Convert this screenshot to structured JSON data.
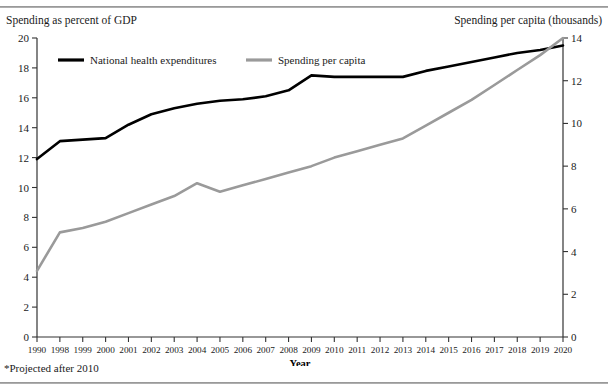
{
  "header": {
    "left_axis_title": "Spending as percent of GDP",
    "right_axis_title": "Spending per capita (thousands)"
  },
  "footnote": "*Projected after 2010",
  "legend": [
    {
      "label": "National health expenditures",
      "color": "#000000",
      "key": "nhe-legend-swatch"
    },
    {
      "label": "Spending per capita",
      "color": "#9a9a9a",
      "key": "spc-legend-swatch"
    }
  ],
  "chart_data": {
    "type": "line",
    "title": "",
    "xlabel": "Year",
    "categories": [
      "1990",
      "1998",
      "1999",
      "2000",
      "2001",
      "2002",
      "2003",
      "2004",
      "2005",
      "2006",
      "2007",
      "2008",
      "2009",
      "2010",
      "2011",
      "2012",
      "2013",
      "2014",
      "2015",
      "2016",
      "2017",
      "2018",
      "2019",
      "2020"
    ],
    "grid": false,
    "legend_position": "top-inside",
    "axes": {
      "left": {
        "label": "Spending as percent of GDP",
        "ticks": [
          0,
          2,
          4,
          6,
          8,
          10,
          12,
          14,
          16,
          18,
          20
        ],
        "ylim": [
          0,
          20
        ]
      },
      "right": {
        "label": "Spending per capita (thousands)",
        "ticks": [
          0,
          2,
          4,
          6,
          8,
          10,
          12,
          14
        ],
        "ylim": [
          0,
          14
        ]
      }
    },
    "series": [
      {
        "name": "National health expenditures",
        "axis": "left",
        "color": "#000000",
        "width": 2.6,
        "values": [
          11.9,
          13.1,
          13.2,
          13.3,
          14.2,
          14.9,
          15.3,
          15.6,
          15.8,
          15.9,
          16.1,
          16.5,
          17.5,
          17.4,
          17.4,
          17.4,
          17.4,
          17.8,
          18.1,
          18.4,
          18.7,
          19.0,
          19.2,
          19.5
        ]
      },
      {
        "name": "Spending per capita",
        "axis": "right",
        "color": "#9a9a9a",
        "width": 2.6,
        "values": [
          3.1,
          4.9,
          5.1,
          5.4,
          5.8,
          6.2,
          6.6,
          7.2,
          6.8,
          7.1,
          7.4,
          7.7,
          8.0,
          8.4,
          8.7,
          9.0,
          9.3,
          9.9,
          10.5,
          11.1,
          11.8,
          12.5,
          13.2,
          14.0
        ]
      }
    ]
  }
}
